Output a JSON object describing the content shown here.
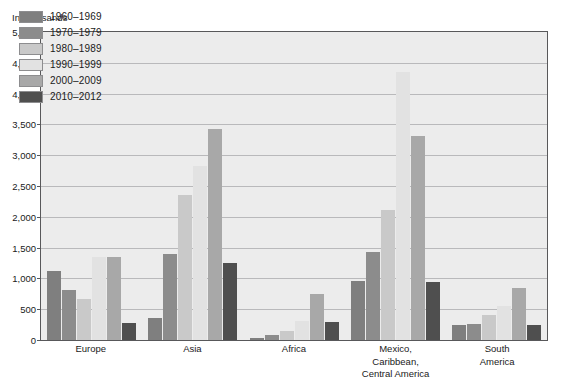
{
  "chart_data": {
    "type": "bar",
    "title": "",
    "subtitle": "",
    "unit_caption": "In thousands",
    "xlabel": "",
    "ylabel": "",
    "ylim": [
      0,
      5000
    ],
    "ytick_step": 500,
    "ytick_labels": [
      "5,000",
      "4,500",
      "4,000",
      "3,500",
      "3,000",
      "2,500",
      "2,000",
      "1,500",
      "1,000",
      "500",
      "0"
    ],
    "ytick_values": [
      5000,
      4500,
      4000,
      3500,
      3000,
      2500,
      2000,
      1500,
      1000,
      500,
      0
    ],
    "grid": true,
    "legend_position": "top-left-inside",
    "categories": [
      "Europe",
      "Asia",
      "Africa",
      "Mexico, Caribbean, Central America",
      "South America"
    ],
    "category_label_lines": [
      [
        "Europe"
      ],
      [
        "Asia"
      ],
      [
        "Africa"
      ],
      [
        "Mexico,",
        "Caribbean,",
        "Central America"
      ],
      [
        "South",
        "America"
      ]
    ],
    "series": [
      {
        "name": "1960–1969",
        "color": "#7f7f7f",
        "values": [
          1120,
          360,
          30,
          950,
          250
        ]
      },
      {
        "name": "1970–1979",
        "color": "#8c8c8c",
        "values": [
          820,
          1390,
          80,
          1430,
          260
        ]
      },
      {
        "name": "1980–1989",
        "color": "#c9c9c9",
        "values": [
          660,
          2360,
          140,
          2110,
          400
        ]
      },
      {
        "name": "1990–1999",
        "color": "#e2e2e2",
        "values": [
          1340,
          2820,
          310,
          4350,
          560
        ]
      },
      {
        "name": "2000–2009",
        "color": "#a8a8a8",
        "values": [
          1340,
          3430,
          740,
          3320,
          840
        ]
      },
      {
        "name": "2010–2012",
        "color": "#4f4f4f",
        "values": [
          270,
          1250,
          290,
          940,
          250
        ]
      }
    ],
    "colors": {
      "plot_background": "#ececec",
      "gridline": "#b9b9bb",
      "axis_line": "#58585a",
      "page_background": "#ffffff",
      "text": "#1a1a1a"
    }
  }
}
